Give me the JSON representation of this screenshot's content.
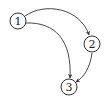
{
  "diagram": {
    "type": "directed-graph",
    "nodes": [
      {
        "id": "1",
        "label": "1",
        "cx": 18,
        "cy": 21
      },
      {
        "id": "2",
        "label": "2",
        "cx": 92,
        "cy": 44
      },
      {
        "id": "3",
        "label": "3",
        "cx": 69,
        "cy": 87
      }
    ],
    "edges": [
      {
        "from": "1",
        "to": "2"
      },
      {
        "from": "1",
        "to": "3"
      },
      {
        "from": "2",
        "to": "3"
      }
    ],
    "colors": {
      "stroke": "#333333",
      "background": "#ffffff"
    }
  }
}
